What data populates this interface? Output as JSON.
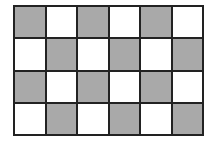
{
  "grid": {
    "rows": 4,
    "cols": 6,
    "colors": {
      "gray": "#a9a9a9",
      "white": "#ffffff",
      "border": "#222222"
    },
    "cells": [
      [
        "gray",
        "white",
        "gray",
        "white",
        "gray",
        "white"
      ],
      [
        "white",
        "gray",
        "white",
        "gray",
        "white",
        "gray"
      ],
      [
        "gray",
        "white",
        "gray",
        "white",
        "gray",
        "white"
      ],
      [
        "white",
        "gray",
        "white",
        "gray",
        "white",
        "gray"
      ]
    ]
  }
}
